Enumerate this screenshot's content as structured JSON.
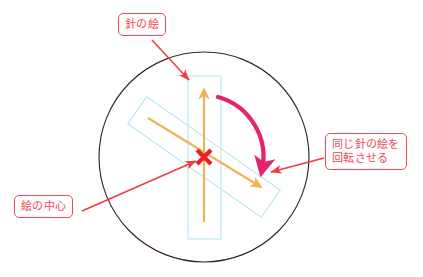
{
  "diagram": {
    "callouts": {
      "needle_picture": "針の絵",
      "rotate_same_line1": "同じ針の絵を",
      "rotate_same_line2": "回転させる",
      "picture_center": "絵の中心"
    },
    "shapes": {
      "circle": {
        "name": "outer-circle",
        "cx": 204,
        "cy": 157,
        "r": 105,
        "stroke": "#3b2420"
      },
      "upright_rect": {
        "name": "needle-bounding-box-upright",
        "x": 188,
        "y": 76,
        "width": 33,
        "height": 163,
        "stroke": "#b6e6f2"
      },
      "rotated_rect": {
        "name": "needle-bounding-box-rotated",
        "cx": 204,
        "cy": 157,
        "width": 163,
        "height": 33,
        "rotation_deg": 35,
        "stroke": "#b6e6f2"
      },
      "center_marker": {
        "name": "picture-center-x-marker",
        "x": 204,
        "y": 157,
        "color": "#e8202a"
      },
      "needle_arrow_up": {
        "name": "needle-arrow-upright",
        "x1": 204,
        "y1": 222,
        "x2": 204,
        "y2": 85,
        "color": "#f0b255"
      },
      "needle_arrow_rotated": {
        "name": "needle-arrow-rotated",
        "x1": 148,
        "y1": 118,
        "x2": 265,
        "y2": 190,
        "color": "#f0b255"
      },
      "rotation_arc": {
        "name": "rotation-direction-arc",
        "color": "#e5246a",
        "from_deg": -75,
        "to_deg": 20,
        "radius": 62
      }
    },
    "colors": {
      "callout_border": "#ef4a54",
      "callout_text": "#ef4a54",
      "leader_line": "#ee3b44",
      "circle_stroke": "#3b2420",
      "box_stroke": "#b6e6f2",
      "needle_arrow": "#f0b255",
      "rotation_arc": "#e5246a",
      "center_marker": "#e8202a",
      "background": "#ffffff"
    }
  }
}
